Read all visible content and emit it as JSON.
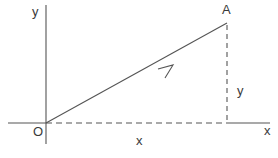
{
  "diagram": {
    "type": "vector-components",
    "colors": {
      "line": "#555555",
      "text": "#3a3a3a",
      "background": "#ffffff"
    },
    "labels": {
      "y_axis": "y",
      "x_axis": "x",
      "origin": "O",
      "point": "A",
      "x_component": "x",
      "y_component": "y"
    },
    "origin": {
      "x": 46,
      "y": 123
    },
    "point_A": {
      "x": 227,
      "y": 23
    }
  }
}
